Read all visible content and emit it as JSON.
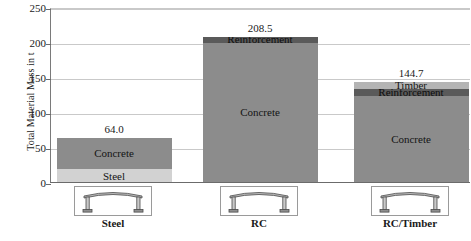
{
  "chart_data": {
    "type": "bar",
    "subtype": "stacked-bar",
    "title": "",
    "xlabel": "",
    "ylabel": "Total Material Mass in t",
    "ylim": [
      0,
      250
    ],
    "yticks": [
      0,
      50,
      100,
      150,
      200,
      250
    ],
    "grid": true,
    "legend": "none (segments labelled in place)",
    "categories": [
      "Steel",
      "RC",
      "RC/Timber"
    ],
    "totals": [
      64.0,
      208.5,
      144.7
    ],
    "total_labels": [
      "64.0",
      "208.5",
      "144.7"
    ],
    "series": [
      {
        "name": "Steel",
        "values": [
          20.0,
          0,
          0
        ]
      },
      {
        "name": "Concrete",
        "values": [
          44.0,
          200.5,
          124.7
        ]
      },
      {
        "name": "Reinforcement",
        "values": [
          0,
          8.0,
          9.0
        ]
      },
      {
        "name": "Timber",
        "values": [
          0,
          0,
          11.0
        ]
      }
    ],
    "bars": [
      {
        "category": "Steel",
        "total_label": "64.0",
        "segments": [
          {
            "name": "Concrete",
            "value": 44.0,
            "label": "Concrete",
            "fill": "#8c8c8c"
          },
          {
            "name": "Steel",
            "value": 20.0,
            "label": "Steel",
            "fill": "#d2d2d2"
          }
        ]
      },
      {
        "category": "RC",
        "total_label": "208.5",
        "segments": [
          {
            "name": "Reinforcement",
            "value": 8.0,
            "label": "Reinforcement",
            "fill": "#5a5a5a"
          },
          {
            "name": "Concrete",
            "value": 200.5,
            "label": "Concrete",
            "fill": "#8c8c8c"
          }
        ]
      },
      {
        "category": "RC/Timber",
        "total_label": "144.7",
        "segments": [
          {
            "name": "Timber",
            "value": 11.0,
            "label": "Timber",
            "fill": "#b4b4b4"
          },
          {
            "name": "Reinforcement",
            "value": 9.0,
            "label": "Reinforcement",
            "fill": "#5a5a5a"
          },
          {
            "name": "Concrete",
            "value": 124.7,
            "label": "Concrete",
            "fill": "#8c8c8c"
          }
        ]
      }
    ],
    "colors": {
      "concrete": "#8c8c8c",
      "steel": "#d2d2d2",
      "reinforcement": "#5a5a5a",
      "timber": "#b4b4b4",
      "gridline": "#c9c9c9",
      "axis": "#6b6b6b"
    }
  },
  "axis": {
    "y_title": "Total Material Mass in t",
    "ticks": [
      "250",
      "200",
      "150",
      "100",
      "50",
      "0"
    ]
  },
  "categories": [
    {
      "label": "Steel",
      "icon": "portal-frame-icon"
    },
    {
      "label": "RC",
      "icon": "portal-frame-icon"
    },
    {
      "label": "RC/Timber",
      "icon": "portal-frame-icon"
    }
  ]
}
